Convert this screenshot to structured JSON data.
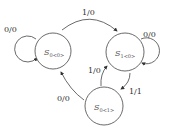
{
  "diagram": {
    "type": "state-machine",
    "states": [
      {
        "id": "s0_0",
        "name": "S",
        "subscript": "0<0>"
      },
      {
        "id": "s1_0",
        "name": "S",
        "subscript": "1<0>"
      },
      {
        "id": "s0_1",
        "name": "S",
        "subscript": "0<1>"
      }
    ],
    "transitions": [
      {
        "from": "s0_0",
        "to": "s0_0",
        "label": "0/0"
      },
      {
        "from": "s0_0",
        "to": "s1_0",
        "label": "1/0"
      },
      {
        "from": "s1_0",
        "to": "s1_0",
        "label": "0/0"
      },
      {
        "from": "s1_0",
        "to": "s0_1",
        "label": "1/1"
      },
      {
        "from": "s0_1",
        "to": "s1_0",
        "label": "1/0"
      },
      {
        "from": "s0_1",
        "to": "s0_0",
        "label": "0/0"
      }
    ]
  }
}
